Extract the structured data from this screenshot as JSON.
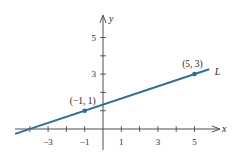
{
  "chart_data": {
    "type": "line",
    "title": "",
    "xlabel": "x",
    "ylabel": "y",
    "xlim": [
      -5.5,
      6.5
    ],
    "ylim": [
      -0.7,
      6.5
    ],
    "x_ticks": [
      -4,
      -3,
      -2,
      -1,
      1,
      2,
      3,
      4,
      5
    ],
    "x_tick_labels": [
      {
        "value": -3,
        "label": "−3"
      },
      {
        "value": -1,
        "label": "−1"
      },
      {
        "value": 1,
        "label": "1"
      },
      {
        "value": 3,
        "label": "3"
      },
      {
        "value": 5,
        "label": "5"
      }
    ],
    "y_ticks": [
      1,
      2,
      3,
      4,
      5
    ],
    "y_tick_labels": [
      {
        "value": 3,
        "label": "3"
      },
      {
        "value": 5,
        "label": "5"
      }
    ],
    "grid": false,
    "series": [
      {
        "name": "L",
        "color": "#2e6e96",
        "line": {
          "x_start": -4.8,
          "x_end": 5.8,
          "slope": 0.3333,
          "intercept": 1.3333
        },
        "points": [
          {
            "x": -1,
            "y": 1,
            "label": "(−1, 1)"
          },
          {
            "x": 5,
            "y": 3,
            "label": "(5, 3)"
          }
        ]
      }
    ],
    "annotations": [
      {
        "text": "L",
        "x": 6.1,
        "y": 3.1
      }
    ]
  },
  "colors": {
    "axis": "#3a3a3a",
    "line": "#2e6e96",
    "text": "#2a2a2a"
  }
}
